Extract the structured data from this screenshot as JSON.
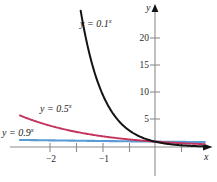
{
  "figure": {
    "axes": {
      "x_axis_label": "x",
      "y_axis_label": "y",
      "x_tick_labels": [
        "−2",
        "−1"
      ],
      "y_tick_labels": [
        "20",
        "15",
        "10",
        "5"
      ]
    },
    "curve_labels": {
      "black": "y = 0.1",
      "black_exp": "x",
      "red": "y = 0.5",
      "red_exp": "x",
      "blue": "y = 0.9",
      "blue_exp": "x"
    },
    "colors": {
      "black_curve": "#141414",
      "red_curve": "#c4335c",
      "blue_curve": "#5b9bd5",
      "axis": "#8c8c8c",
      "text": "#1a1a1a",
      "background": "#ffffff"
    }
  },
  "chart_data": {
    "type": "line",
    "title": "",
    "xlabel": "x",
    "ylabel": "y",
    "xlim": [
      -2.9,
      1.2
    ],
    "ylim": [
      -1.2,
      24.5
    ],
    "grid": false,
    "legend": "inline-curve-labels",
    "x_ticks_major": [
      -2,
      -1
    ],
    "x_ticks_minor": [
      -1.5,
      -0.5
    ],
    "y_ticks_major": [
      5,
      10,
      15,
      20
    ],
    "series": [
      {
        "name": "y = 0.1^x",
        "color": "#141414",
        "base": 0.1,
        "x": [
          -1.45,
          -1.3,
          -1.15,
          -1.0,
          -0.85,
          -0.7,
          -0.55,
          -0.4,
          -0.25,
          -0.1,
          0.0,
          0.15,
          0.3,
          0.5,
          0.7,
          0.9,
          1.1
        ],
        "y": [
          28.2,
          19.95,
          14.13,
          10.0,
          7.08,
          5.01,
          3.55,
          2.51,
          1.78,
          1.26,
          1.0,
          0.71,
          0.5,
          0.32,
          0.2,
          0.13,
          0.08
        ]
      },
      {
        "name": "y = 0.5^x",
        "color": "#c4335c",
        "base": 0.5,
        "x": [
          -2.55,
          -2.3,
          -2.0,
          -1.7,
          -1.4,
          -1.1,
          -0.8,
          -0.5,
          -0.2,
          0.0,
          0.3,
          0.6,
          0.9,
          1.1
        ],
        "y": [
          5.86,
          4.92,
          4.0,
          3.25,
          2.64,
          2.14,
          1.74,
          1.41,
          1.15,
          1.0,
          0.81,
          0.66,
          0.54,
          0.47
        ]
      },
      {
        "name": "y = 0.9^x",
        "color": "#5b9bd5",
        "base": 0.9,
        "x": [
          -2.55,
          -2.0,
          -1.5,
          -1.0,
          -0.5,
          0.0,
          0.5,
          1.0,
          1.1
        ],
        "y": [
          1.31,
          1.23,
          1.17,
          1.11,
          1.05,
          1.0,
          0.95,
          0.9,
          0.89
        ]
      }
    ]
  }
}
